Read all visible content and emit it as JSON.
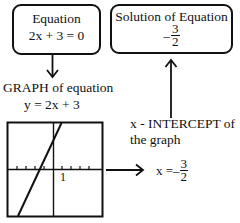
{
  "equation_box": {
    "title": "Equation",
    "equation": "2x + 3 = 0"
  },
  "solution_box": {
    "title": "Solution of Equation",
    "sign": "–",
    "numerator": "3",
    "denominator": "2"
  },
  "graph_section": {
    "title": "GRAPH of equation",
    "equation": "y = 2x + 3",
    "tick_label": "1"
  },
  "intercept_section": {
    "line1": "x - INTERCEPT of",
    "line2": "the graph"
  },
  "intercept_result": {
    "lhs": "x =",
    "sign": "–",
    "numerator": "3",
    "denominator": "2"
  },
  "colors": {
    "ink": "#111111",
    "background": "#ffffff"
  }
}
